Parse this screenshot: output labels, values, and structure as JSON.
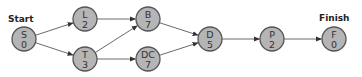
{
  "diagram": {
    "type": "activity-network",
    "labels": {
      "start": "Start",
      "finish": "Finish"
    },
    "nodes": [
      {
        "id": "S",
        "name": "S",
        "duration": "0",
        "x": 24,
        "y": 39
      },
      {
        "id": "L",
        "name": "L",
        "duration": "2",
        "x": 85,
        "y": 19
      },
      {
        "id": "T",
        "name": "T",
        "duration": "3",
        "x": 85,
        "y": 59
      },
      {
        "id": "B",
        "name": "B",
        "duration": "7",
        "x": 148,
        "y": 19
      },
      {
        "id": "DC",
        "name": "DC",
        "duration": "7",
        "x": 148,
        "y": 59
      },
      {
        "id": "D",
        "name": "D",
        "duration": "5",
        "x": 210,
        "y": 39
      },
      {
        "id": "P",
        "name": "P",
        "duration": "2",
        "x": 272,
        "y": 39
      },
      {
        "id": "F",
        "name": "F",
        "duration": "0",
        "x": 334,
        "y": 39
      }
    ],
    "edges": [
      {
        "from": "S",
        "to": "L"
      },
      {
        "from": "S",
        "to": "T"
      },
      {
        "from": "L",
        "to": "B"
      },
      {
        "from": "T",
        "to": "B"
      },
      {
        "from": "T",
        "to": "DC"
      },
      {
        "from": "B",
        "to": "D"
      },
      {
        "from": "DC",
        "to": "D"
      },
      {
        "from": "D",
        "to": "P"
      },
      {
        "from": "P",
        "to": "F"
      }
    ],
    "colors": {
      "node_fill": "#b5b5b5",
      "node_stroke": "#555555",
      "edge": "#444444"
    }
  }
}
